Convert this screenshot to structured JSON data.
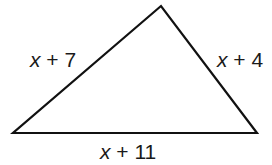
{
  "figure": {
    "shape": "triangle",
    "stroke_color": "#111111",
    "vertices": {
      "top": [
        161,
        6
      ],
      "bottom_left": [
        13,
        133
      ],
      "bottom_right": [
        257,
        133
      ]
    },
    "sides": {
      "left": {
        "variable": "x",
        "operator": "+",
        "constant": "7"
      },
      "right": {
        "variable": "x",
        "operator": "+",
        "constant": "4"
      },
      "bottom": {
        "variable": "x",
        "operator": "+",
        "constant": "11"
      }
    }
  }
}
